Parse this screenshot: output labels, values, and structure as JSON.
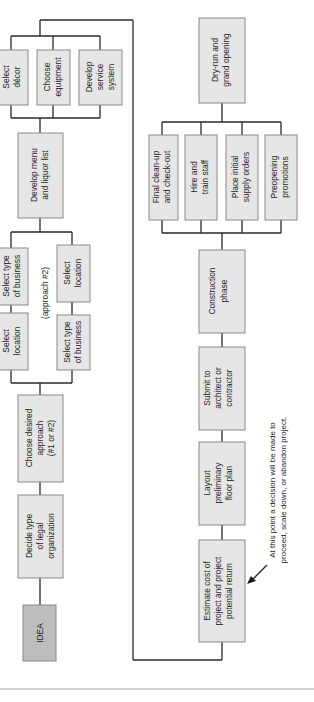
{
  "diagram": {
    "type": "flowchart",
    "orientation": "rotated-90-ccw",
    "nodes": [
      {
        "id": "idea",
        "lines": [
          "IDEA"
        ],
        "style": "dark"
      },
      {
        "id": "legal",
        "lines": [
          "Decide type",
          "of legal",
          "organization"
        ]
      },
      {
        "id": "approach",
        "lines": [
          "Choose desired",
          "approach",
          "(#1 or #2)"
        ]
      },
      {
        "id": "a1_location",
        "lines": [
          "Select",
          "location"
        ]
      },
      {
        "id": "a1_business",
        "lines": [
          "Select type",
          "of business"
        ]
      },
      {
        "id": "a2_business",
        "lines": [
          "Select type",
          "of business"
        ]
      },
      {
        "id": "a2_location",
        "lines": [
          "Select",
          "location"
        ]
      },
      {
        "id": "menu",
        "lines": [
          "Develop menu",
          "and liquor list"
        ]
      },
      {
        "id": "decor",
        "lines": [
          "Select",
          "décor"
        ]
      },
      {
        "id": "equipment",
        "lines": [
          "Choose",
          "equipment"
        ]
      },
      {
        "id": "service",
        "lines": [
          "Develop",
          "service",
          "system"
        ]
      },
      {
        "id": "estimate",
        "lines": [
          "Estimate cost of",
          "project and project",
          "potential return"
        ]
      },
      {
        "id": "layout",
        "lines": [
          "Layout",
          "preliminary",
          "floor plan"
        ]
      },
      {
        "id": "submit",
        "lines": [
          "Submit to",
          "architect or",
          "contractor"
        ]
      },
      {
        "id": "construction",
        "lines": [
          "Construction",
          "phase"
        ]
      },
      {
        "id": "cleanup",
        "lines": [
          "Final clean-up",
          "and check-out"
        ]
      },
      {
        "id": "hire",
        "lines": [
          "Hire and",
          "train staff"
        ]
      },
      {
        "id": "supply",
        "lines": [
          "Place initial",
          "supply orders"
        ]
      },
      {
        "id": "promotions",
        "lines": [
          "Preopening",
          "promotions"
        ]
      },
      {
        "id": "opening",
        "lines": [
          "Dry-run and",
          "grand opening"
        ]
      }
    ],
    "labels": {
      "approach2": "(approach #2)",
      "annotation_line1": "At this point a decision will be made to",
      "annotation_line2": "proceed, scale down, or abandon project."
    },
    "edges": [
      [
        "idea",
        "legal"
      ],
      [
        "legal",
        "approach"
      ],
      [
        "approach",
        "a1_location"
      ],
      [
        "a1_location",
        "a1_business"
      ],
      [
        "approach",
        "a2_business"
      ],
      [
        "a2_business",
        "a2_location"
      ],
      [
        "a1_business",
        "menu"
      ],
      [
        "a2_location",
        "menu"
      ],
      [
        "menu",
        "decor"
      ],
      [
        "menu",
        "equipment"
      ],
      [
        "menu",
        "service"
      ],
      [
        "decor",
        "estimate"
      ],
      [
        "equipment",
        "estimate"
      ],
      [
        "service",
        "estimate"
      ],
      [
        "estimate",
        "layout"
      ],
      [
        "layout",
        "submit"
      ],
      [
        "submit",
        "construction"
      ],
      [
        "construction",
        "cleanup"
      ],
      [
        "construction",
        "hire"
      ],
      [
        "construction",
        "supply"
      ],
      [
        "construction",
        "promotions"
      ],
      [
        "cleanup",
        "opening"
      ],
      [
        "hire",
        "opening"
      ],
      [
        "supply",
        "opening"
      ],
      [
        "promotions",
        "opening"
      ]
    ]
  }
}
